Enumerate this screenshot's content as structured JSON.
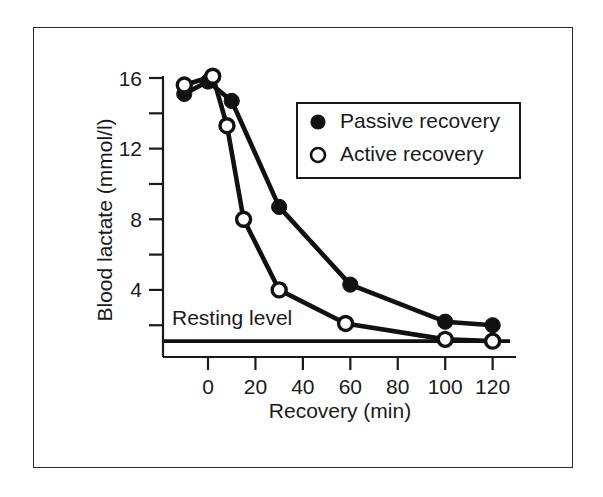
{
  "chart_data": {
    "type": "line",
    "title": "",
    "xlabel": "Recovery (min)",
    "ylabel": "Blood lactate (mmol/l)",
    "xlim": [
      -14,
      128
    ],
    "ylim": [
      0.0,
      17.2
    ],
    "xticks": [
      0,
      20,
      40,
      60,
      80,
      100,
      120
    ],
    "xticklabels": [
      "0",
      "20",
      "40",
      "60",
      "80",
      "100",
      "120"
    ],
    "yticks": [
      2,
      4,
      6,
      8,
      10,
      12,
      14,
      16
    ],
    "yticklabels": [
      "",
      "4",
      "",
      "8",
      "",
      "12",
      "",
      "16"
    ],
    "ylabeled_ticks": [
      4,
      8,
      12,
      16
    ],
    "grid": false,
    "legend_position": "upper-right-inset",
    "series": [
      {
        "name": "Passive recovery",
        "marker": "filled-circle",
        "color": "#111111",
        "x": [
          -10,
          0,
          10,
          30,
          60,
          100,
          120
        ],
        "y": [
          15.1,
          15.8,
          14.7,
          8.7,
          4.3,
          2.2,
          2.0
        ]
      },
      {
        "name": "Active recovery",
        "marker": "open-circle",
        "color": "#111111",
        "x": [
          -10,
          2,
          8,
          15,
          30,
          58,
          100,
          120
        ],
        "y": [
          15.6,
          16.1,
          13.3,
          8.0,
          4.0,
          2.1,
          1.2,
          1.1
        ]
      }
    ],
    "annotations": [
      {
        "name": "resting-level",
        "text": "Resting level",
        "type": "horizontal-line-with-label",
        "y_value": 1.1,
        "label_x": -12,
        "label_y": 2.0
      }
    ]
  },
  "axes": {
    "y_title": "Blood lactate (mmol/l)",
    "x_title": "Recovery (min)",
    "x_tick_labels": [
      "0",
      "20",
      "40",
      "60",
      "80",
      "100",
      "120"
    ],
    "y_tick_labels": [
      "16",
      "12",
      "8",
      "4"
    ]
  },
  "legend": {
    "entries": [
      {
        "marker": "filled-circle",
        "label": "Passive recovery"
      },
      {
        "marker": "open-circle",
        "label": "Active recovery"
      }
    ]
  },
  "annotation": {
    "resting_level_label": "Resting level"
  },
  "colors": {
    "ink": "#111111",
    "border": "#2b2b2b",
    "background": "#ffffff"
  }
}
